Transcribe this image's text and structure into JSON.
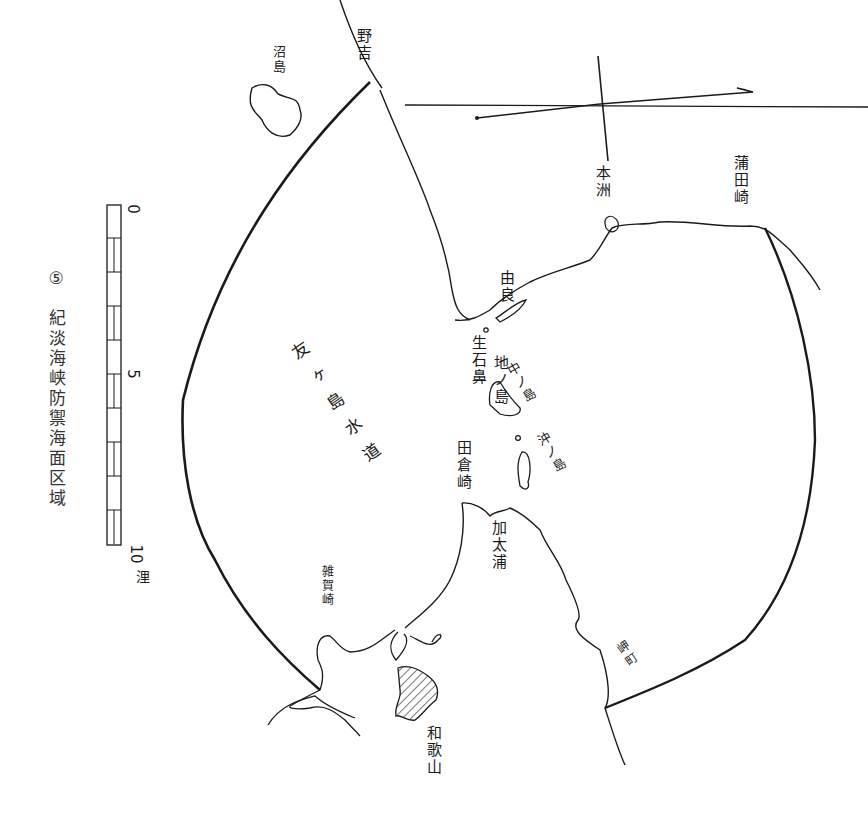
{
  "map": {
    "title": "紀淡海峡防禦海面区域",
    "figure_number": "⑤",
    "orientation": "rotated 90° clockwise",
    "colors": {
      "ink": "#1a1a1a",
      "paper": "#ffffff",
      "caption": "#333333"
    },
    "scale_bar": {
      "start_label": "0",
      "mid_label": "5",
      "end_label": "10",
      "unit": "浬"
    },
    "places": [
      {
        "id": "awaji-tip",
        "label": "野吉"
      },
      {
        "id": "okinoshima",
        "label": "沼島"
      },
      {
        "id": "honshu",
        "label": "本洲"
      },
      {
        "id": "gamoda-point",
        "label": "蒲田崎"
      },
      {
        "id": "yura",
        "label": "由良"
      },
      {
        "id": "ikuishi-point",
        "label": "生石鼻"
      },
      {
        "id": "channel",
        "label": "友ヶ島水道"
      },
      {
        "id": "jinoshima",
        "label": "地ノ島"
      },
      {
        "id": "nakanoshima",
        "label": "中ノ島"
      },
      {
        "id": "okinoshima-2",
        "label": "沖ノ島"
      },
      {
        "id": "tanowa-point",
        "label": "田倉崎"
      },
      {
        "id": "kada-bay",
        "label": "加太浦"
      },
      {
        "id": "wakayama",
        "label": "和歌山"
      },
      {
        "id": "southern-point",
        "label": "雑賀崎"
      },
      {
        "id": "hinomisaki",
        "label": "岬町"
      }
    ]
  }
}
